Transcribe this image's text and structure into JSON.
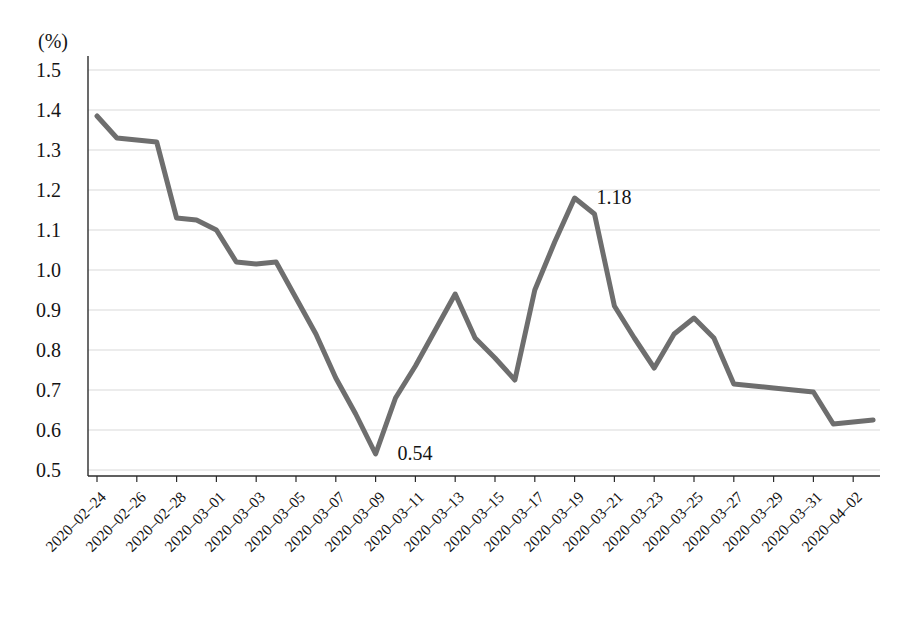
{
  "chart_data": {
    "type": "line",
    "title": "",
    "subtitle": "",
    "xlabel": "",
    "ylabel": "(%)",
    "unit_label": "(%)",
    "ylim": [
      0.5,
      1.5
    ],
    "y_ticks": [
      "1.5",
      "1.4",
      "1.3",
      "1.2",
      "1.1",
      "1.0",
      "0.9",
      "0.8",
      "0.7",
      "0.6",
      "0.5"
    ],
    "y_tick_values": [
      1.5,
      1.4,
      1.3,
      1.2,
      1.1,
      1.0,
      0.9,
      0.8,
      0.7,
      0.6,
      0.5
    ],
    "grid": true,
    "grid_axis": "y",
    "legend": "none",
    "line_color": "#6e6e6e",
    "grid_color": "#d9d9d9",
    "text_color": "#141414",
    "x_tick_labels": [
      "2020–02–24",
      "2020–02–26",
      "2020–02–28",
      "2020–03–01",
      "2020–03–03",
      "2020–03–05",
      "2020–03–07",
      "2020–03–09",
      "2020–03–11",
      "2020–03–13",
      "2020–03–15",
      "2020–03–17",
      "2020–03–19",
      "2020–03–21",
      "2020–03–23",
      "2020–03–25",
      "2020–03–27",
      "2020–03–29",
      "2020–03–31",
      "2020–04–02"
    ],
    "x": [
      "2020-02-24",
      "2020-02-25",
      "2020-02-26",
      "2020-02-27",
      "2020-02-28",
      "2020-02-29",
      "2020-03-01",
      "2020-03-02",
      "2020-03-03",
      "2020-03-04",
      "2020-03-05",
      "2020-03-06",
      "2020-03-07",
      "2020-03-08",
      "2020-03-09",
      "2020-03-10",
      "2020-03-11",
      "2020-03-12",
      "2020-03-13",
      "2020-03-14",
      "2020-03-15",
      "2020-03-16",
      "2020-03-17",
      "2020-03-18",
      "2020-03-19",
      "2020-03-20",
      "2020-03-21",
      "2020-03-22",
      "2020-03-23",
      "2020-03-24",
      "2020-03-25",
      "2020-03-26",
      "2020-03-27",
      "2020-03-28",
      "2020-03-29",
      "2020-03-30",
      "2020-03-31",
      "2020-04-01",
      "2020-04-02",
      "2020-04-03"
    ],
    "values": [
      1.385,
      1.33,
      1.325,
      1.32,
      1.13,
      1.125,
      1.1,
      1.02,
      1.015,
      1.02,
      0.93,
      0.84,
      0.73,
      0.64,
      0.54,
      0.68,
      0.76,
      0.85,
      0.94,
      0.83,
      0.78,
      0.725,
      0.95,
      1.07,
      1.18,
      1.14,
      0.91,
      0.83,
      0.755,
      0.84,
      0.88,
      0.83,
      0.715,
      0.71,
      0.705,
      0.7,
      0.695,
      0.615,
      0.62,
      0.625
    ],
    "annotations": [
      {
        "label": "0.54",
        "x": "2020-03-09",
        "y": 0.54
      },
      {
        "label": "1.18",
        "x": "2020-03-19",
        "y": 1.18
      }
    ]
  }
}
